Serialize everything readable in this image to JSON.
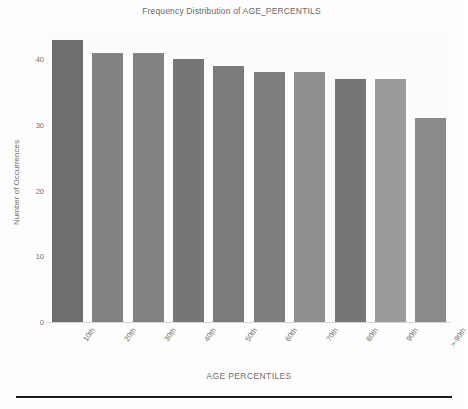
{
  "chart_data": {
    "type": "bar",
    "title": "Frequency Distribution of AGE_PERCENTILS",
    "xlabel": "AGE PERCENTILES",
    "ylabel": "Number of Occurrences",
    "categories": [
      "10th",
      "20th",
      "30th",
      "40th",
      "50th",
      "60th",
      "70th",
      "80th",
      "90th",
      ">-90th"
    ],
    "values": [
      43,
      41,
      41,
      40,
      39,
      38,
      38,
      37,
      37,
      31
    ],
    "ylim": [
      0,
      44
    ],
    "yticks": [
      0,
      10,
      20,
      30,
      40
    ],
    "ytick_labels": [
      "0",
      "10",
      "20",
      "30",
      "40"
    ],
    "grid": false,
    "legend": "none",
    "bar_colors": [
      "#6e6e6e",
      "#828282",
      "#828282",
      "#767676",
      "#7b7b7b",
      "#7e7e7e",
      "#8f8f8f",
      "#767676",
      "#9a9a9a",
      "#8a8a8a"
    ]
  },
  "figure": {
    "background": "#fdfdfd",
    "axis_color": "#c9c9c9",
    "text_color": "#6e6e6e",
    "rule_color": "#1c1c1c"
  }
}
